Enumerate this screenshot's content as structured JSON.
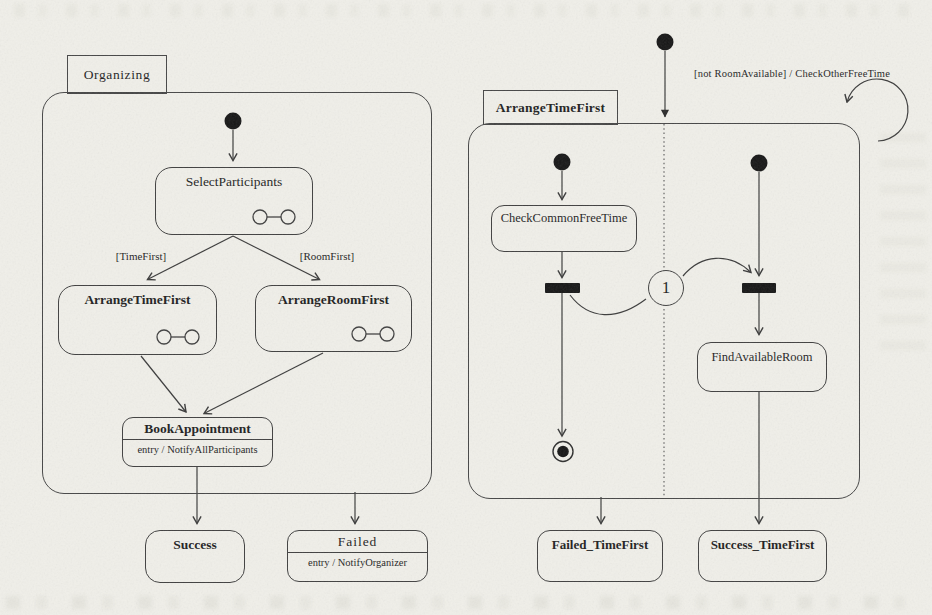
{
  "colors": {
    "paper": "#f0efe9",
    "line": "#3a3a3a",
    "ink": "#1e1e1e"
  },
  "left_diagram": {
    "tab_label": "Organizing",
    "states": {
      "select_participants": {
        "label": "SelectParticipants"
      },
      "arrange_time_first": {
        "label": "ArrangeTimeFirst"
      },
      "arrange_room_first": {
        "label": "ArrangeRoomFirst"
      },
      "book_appointment": {
        "label": "BookAppointment",
        "entry_action": "entry / NotifyAllParticipants"
      },
      "success": {
        "label": "Success"
      },
      "failed": {
        "label": "Failed",
        "entry_action": "entry / NotifyOrganizer"
      }
    },
    "guards": {
      "time_first": "[TimeFirst]",
      "room_first": "[RoomFirst]"
    }
  },
  "right_diagram": {
    "tab_label": "ArrangeTimeFirst",
    "self_transition_label": "[not RoomAvailable] / CheckOtherFreeTime",
    "connector_label": "1",
    "states": {
      "check_common_free_time": {
        "label": "CheckCommonFreeTime"
      },
      "find_available_room": {
        "label": "FindAvailableRoom"
      },
      "failed_time_first": {
        "label": "Failed_TimeFirst"
      },
      "success_time_first": {
        "label": "Success_TimeFirst"
      }
    }
  },
  "icons": {
    "initial_state": "initial-state-icon",
    "final_state": "final-state-icon",
    "fork_join_bar": "fork-join-bar-icon",
    "substate": "substate-icon"
  }
}
